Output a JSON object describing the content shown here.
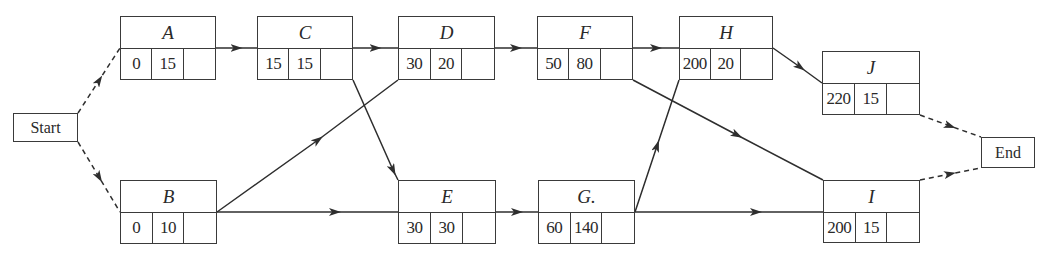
{
  "diagram": {
    "type": "activity-on-node network",
    "terminals": {
      "start": {
        "label": "Start"
      },
      "end": {
        "label": "End"
      }
    },
    "nodes": {
      "A": {
        "label": "A",
        "cells": [
          "0",
          "15",
          ""
        ]
      },
      "B": {
        "label": "B",
        "cells": [
          "0",
          "10",
          ""
        ]
      },
      "C": {
        "label": "C",
        "cells": [
          "15",
          "15",
          ""
        ]
      },
      "D": {
        "label": "D",
        "cells": [
          "30",
          "20",
          ""
        ]
      },
      "E": {
        "label": "E",
        "cells": [
          "30",
          "30",
          ""
        ]
      },
      "F": {
        "label": "F",
        "cells": [
          "50",
          "80",
          ""
        ]
      },
      "G": {
        "label": "G.",
        "cells": [
          "60",
          "140",
          ""
        ]
      },
      "H": {
        "label": "H",
        "cells": [
          "200",
          "20",
          ""
        ]
      },
      "I": {
        "label": "I",
        "cells": [
          "200",
          "15",
          ""
        ]
      },
      "J": {
        "label": "J",
        "cells": [
          "220",
          "15",
          ""
        ]
      }
    },
    "edges": [
      {
        "from": "Start",
        "to": "A",
        "style": "dashed"
      },
      {
        "from": "Start",
        "to": "B",
        "style": "dashed"
      },
      {
        "from": "A",
        "to": "C",
        "style": "solid"
      },
      {
        "from": "C",
        "to": "D",
        "style": "solid"
      },
      {
        "from": "C",
        "to": "E",
        "style": "solid"
      },
      {
        "from": "B",
        "to": "D",
        "style": "solid"
      },
      {
        "from": "B",
        "to": "E",
        "style": "solid"
      },
      {
        "from": "D",
        "to": "F",
        "style": "solid"
      },
      {
        "from": "E",
        "to": "G",
        "style": "solid"
      },
      {
        "from": "F",
        "to": "H",
        "style": "solid"
      },
      {
        "from": "F",
        "to": "I",
        "style": "solid"
      },
      {
        "from": "G",
        "to": "H",
        "style": "solid"
      },
      {
        "from": "G",
        "to": "I",
        "style": "solid"
      },
      {
        "from": "H",
        "to": "J",
        "style": "solid"
      },
      {
        "from": "J",
        "to": "End",
        "style": "dashed"
      },
      {
        "from": "I",
        "to": "End",
        "style": "dashed"
      }
    ],
    "colors": {
      "line": "#2e2e2e",
      "background": "#ffffff"
    }
  }
}
